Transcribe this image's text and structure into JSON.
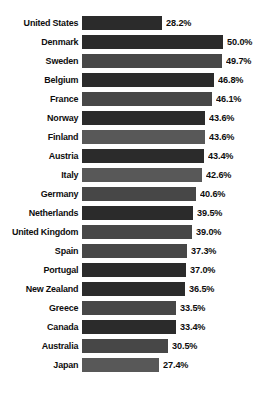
{
  "chart_data": {
    "type": "bar",
    "orientation": "horizontal",
    "title": "",
    "subtitle": "",
    "xlabel": "",
    "ylabel": "",
    "xlim": [
      0,
      50
    ],
    "grid": false,
    "legend": null,
    "value_suffix": "%",
    "categories": [
      "United States",
      "Denmark",
      "Sweden",
      "Belgium",
      "France",
      "Norway",
      "Finland",
      "Austria",
      "Italy",
      "Germany",
      "Netherlands",
      "United Kingdom",
      "Spain",
      "Portugal",
      "New Zealand",
      "Greece",
      "Canada",
      "Australia",
      "Japan"
    ],
    "values": [
      28.2,
      50.0,
      49.7,
      46.8,
      46.1,
      43.6,
      43.6,
      43.4,
      42.6,
      40.6,
      39.5,
      39.0,
      37.3,
      37.0,
      36.5,
      33.5,
      33.4,
      30.5,
      27.4
    ],
    "value_labels": [
      "28.2%",
      "50.0%",
      "49.7%",
      "46.8%",
      "46.1%",
      "43.6%",
      "43.6%",
      "43.4%",
      "42.6%",
      "40.6%",
      "39.5%",
      "39.0%",
      "37.3%",
      "37.0%",
      "36.5%",
      "33.5%",
      "33.4%",
      "30.5%",
      "27.4%"
    ],
    "bar_tones": [
      "dark",
      "dark",
      "mid",
      "dark",
      "mid",
      "dark",
      "light",
      "dark",
      "light",
      "mid",
      "dark",
      "mid",
      "mid",
      "dark",
      "dark",
      "mid",
      "dark",
      "mid",
      "light"
    ],
    "colors": {
      "bar_dark": "#2b2b2b",
      "bar_mid": "#474747",
      "bar_light": "#585858",
      "text": "#0d0d0d",
      "background": "#ffffff"
    }
  }
}
